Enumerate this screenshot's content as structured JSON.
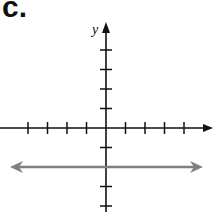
{
  "panel": {
    "label": "c."
  },
  "colors": {
    "axis": "#111111",
    "line": "#808080",
    "background": "#ffffff"
  },
  "chart_data": {
    "type": "line",
    "title": "",
    "xlabel": "",
    "ylabel": "y",
    "xlim": [
      -5,
      5
    ],
    "ylim": [
      -4,
      5
    ],
    "x_ticks": [
      -4,
      -3,
      -2,
      -1,
      1,
      2,
      3,
      4
    ],
    "y_ticks": [
      -4,
      -3,
      -2,
      -1,
      1,
      2,
      3,
      4
    ],
    "tick_labels_shown": false,
    "grid": false,
    "series": [
      {
        "name": "horizontal line",
        "equation": "y = -2",
        "x": [
          -5,
          5
        ],
        "y": [
          -2,
          -2
        ],
        "arrows_both_ends": true
      }
    ]
  }
}
